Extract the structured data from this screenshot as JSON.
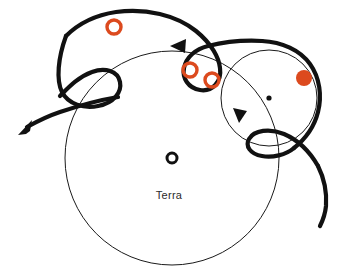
{
  "figure": {
    "background_color": "#ffffff",
    "center_label": "Terra",
    "stroke_color": "#111111",
    "thin_stroke_color": "#1a1a1a",
    "accent_color": "#dc4a1e",
    "width": 338,
    "height": 279
  },
  "chart_data": {
    "type": "scatter",
    "xlabel": "",
    "ylabel": "",
    "grid": false,
    "legend": "none",
    "xlim": [
      0,
      338
    ],
    "ylim": [
      0,
      279
    ],
    "annotations": [
      {
        "text": "Terra",
        "x": 172,
        "y": 196
      }
    ],
    "markers": [
      {
        "name": "planet-marker-upper-left",
        "style": "open-ring",
        "color": "#dc4a1e",
        "x": 114,
        "y": 27,
        "r": 7
      },
      {
        "name": "planet-marker-mid-left",
        "style": "open-ring",
        "color": "#dc4a1e",
        "x": 190,
        "y": 70,
        "r": 7
      },
      {
        "name": "planet-marker-mid-right",
        "style": "open-ring",
        "color": "#dc4a1e",
        "x": 212,
        "y": 80,
        "r": 7
      },
      {
        "name": "planet-marker-filled-right",
        "style": "filled-disk",
        "color": "#dc4a1e",
        "x": 304,
        "y": 78,
        "r": 8
      },
      {
        "name": "terra-body",
        "style": "open-ring",
        "color": "#111111",
        "x": 172,
        "y": 158,
        "r": 5
      },
      {
        "name": "epicycle-center-dot",
        "style": "filled-disk",
        "color": "#111111",
        "x": 269,
        "y": 98,
        "r": 2.6
      }
    ],
    "orbits": [
      {
        "name": "deferent-main",
        "type": "circle",
        "cx": 172,
        "cy": 158,
        "r": 107,
        "stroke": "#1a1a1a",
        "width": 1
      },
      {
        "name": "epicycle-right",
        "type": "circle",
        "cx": 269,
        "cy": 98,
        "r": 48,
        "stroke": "#1a1a1a",
        "width": 1
      }
    ],
    "arrows": [
      {
        "name": "arrow-deferent-top",
        "x": 178,
        "y": 46,
        "direction": "left"
      },
      {
        "name": "arrow-epicycle-right",
        "x": 240,
        "y": 119,
        "direction": "down"
      },
      {
        "name": "arrow-trajectory-exit-left",
        "x": 22,
        "y": 131,
        "direction": "down-left"
      }
    ],
    "series": [
      {
        "name": "epicyclic-trajectory",
        "description": "Heavy looping epicyclic path with retrograde cusps",
        "style": "thick-black-curve"
      }
    ]
  }
}
